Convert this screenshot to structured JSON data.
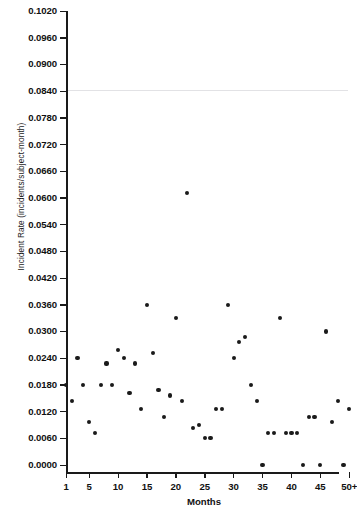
{
  "chart_data": {
    "type": "scatter",
    "title": "",
    "xlabel": "Months",
    "ylabel": "Incident Rate (incidents/subject-month)",
    "xlim": [
      1,
      50
    ],
    "ylim": [
      0.0,
      0.102
    ],
    "grid": false,
    "legend": null,
    "x_tick_labels": [
      "1",
      "5",
      "10",
      "15",
      "20",
      "25",
      "30",
      "35",
      "40",
      "45",
      "50+"
    ],
    "x_tick_values": [
      1,
      5,
      10,
      15,
      20,
      25,
      30,
      35,
      40,
      45,
      50
    ],
    "y_tick_labels": [
      "0.1020",
      "0.0960",
      "0.0900",
      "0.0840",
      "0.0780",
      "0.0720",
      "0.0660",
      "0.0600",
      "0.0540",
      "0.0480",
      "0.0420",
      "0.0360",
      "0.0300",
      "0.0240",
      "0.0180",
      "0.0120",
      "0.0060",
      "0.0000"
    ],
    "y_tick_values": [
      0.102,
      0.096,
      0.09,
      0.084,
      0.078,
      0.072,
      0.066,
      0.06,
      0.054,
      0.048,
      0.042,
      0.036,
      0.03,
      0.024,
      0.018,
      0.012,
      0.006,
      0.0
    ],
    "marker": "filled-circle",
    "marker_color": "#1a1a1a",
    "points": [
      {
        "x": 1,
        "y": 0.018
      },
      {
        "x": 2,
        "y": 0.0144
      },
      {
        "x": 3,
        "y": 0.024
      },
      {
        "x": 4,
        "y": 0.018
      },
      {
        "x": 5,
        "y": 0.0096
      },
      {
        "x": 6,
        "y": 0.0072
      },
      {
        "x": 7,
        "y": 0.018
      },
      {
        "x": 8,
        "y": 0.0228
      },
      {
        "x": 9,
        "y": 0.018
      },
      {
        "x": 10,
        "y": 0.0258
      },
      {
        "x": 11,
        "y": 0.024
      },
      {
        "x": 12,
        "y": 0.0162
      },
      {
        "x": 13,
        "y": 0.0228
      },
      {
        "x": 14,
        "y": 0.0126
      },
      {
        "x": 15,
        "y": 0.036
      },
      {
        "x": 16,
        "y": 0.0252
      },
      {
        "x": 17,
        "y": 0.0168
      },
      {
        "x": 18,
        "y": 0.0108
      },
      {
        "x": 19,
        "y": 0.0156
      },
      {
        "x": 20,
        "y": 0.033
      },
      {
        "x": 21,
        "y": 0.0144
      },
      {
        "x": 22,
        "y": 0.0612
      },
      {
        "x": 23,
        "y": 0.0084
      },
      {
        "x": 24,
        "y": 0.009
      },
      {
        "x": 25,
        "y": 0.006
      },
      {
        "x": 26,
        "y": 0.006
      },
      {
        "x": 27,
        "y": 0.0126
      },
      {
        "x": 28,
        "y": 0.0126
      },
      {
        "x": 29,
        "y": 0.036
      },
      {
        "x": 30,
        "y": 0.024
      },
      {
        "x": 31,
        "y": 0.0276
      },
      {
        "x": 32,
        "y": 0.0288
      },
      {
        "x": 33,
        "y": 0.018
      },
      {
        "x": 34,
        "y": 0.0144
      },
      {
        "x": 35,
        "y": 0.0
      },
      {
        "x": 36,
        "y": 0.0072
      },
      {
        "x": 37,
        "y": 0.0072
      },
      {
        "x": 38,
        "y": 0.033
      },
      {
        "x": 39,
        "y": 0.0072
      },
      {
        "x": 40,
        "y": 0.0072
      },
      {
        "x": 41,
        "y": 0.0072
      },
      {
        "x": 42,
        "y": 0.0
      },
      {
        "x": 43,
        "y": 0.0108
      },
      {
        "x": 44,
        "y": 0.0108
      },
      {
        "x": 45,
        "y": 0.0
      },
      {
        "x": 46,
        "y": 0.03
      },
      {
        "x": 47,
        "y": 0.0096
      },
      {
        "x": 48,
        "y": 0.0144
      },
      {
        "x": 49,
        "y": 0.0
      },
      {
        "x": 50,
        "y": 0.0126
      }
    ]
  }
}
